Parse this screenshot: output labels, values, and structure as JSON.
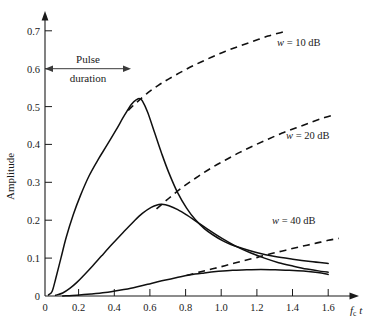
{
  "chart_data": {
    "type": "line",
    "title": "",
    "xlabel": "f_c t",
    "ylabel": "Amplitude",
    "xlim": [
      0,
      1.72
    ],
    "ylim": [
      0,
      0.74
    ],
    "grid": false,
    "legend_position": "inline-right",
    "xticks": [
      "0",
      "0.2",
      "0.4",
      "0.6",
      "0.8",
      "1.0",
      "1.2",
      "1.4",
      "1.6"
    ],
    "xtick_values": [
      0,
      0.2,
      0.4,
      0.6,
      0.8,
      1.0,
      1.2,
      1.4,
      1.6
    ],
    "yticks": [
      "0.1",
      "0.2",
      "0.3",
      "0.4",
      "0.5",
      "0.6",
      "0.7"
    ],
    "ytick_values": [
      0.1,
      0.2,
      0.3,
      0.4,
      0.5,
      0.6,
      0.7
    ],
    "yzero_label": "0",
    "annotations": [
      {
        "name": "pulse-duration",
        "line1": "Pulse",
        "line2": "duration",
        "arrow": "double-headed",
        "x_start": 0.0,
        "x_end": 0.47,
        "y": 0.6
      }
    ],
    "series": [
      {
        "name": "w = 10 dB (solid)",
        "label": "",
        "style": "solid",
        "x": [
          0.02,
          0.04,
          0.06,
          0.09,
          0.12,
          0.16,
          0.2,
          0.25,
          0.3,
          0.35,
          0.4,
          0.45,
          0.49,
          0.52,
          0.535,
          0.55,
          0.58,
          0.62,
          0.66,
          0.7,
          0.75,
          0.8,
          0.85,
          0.9,
          0.95,
          1.0,
          1.05,
          1.1,
          1.2,
          1.3,
          1.4,
          1.5,
          1.6
        ],
        "y": [
          0.003,
          0.012,
          0.045,
          0.1,
          0.155,
          0.215,
          0.265,
          0.318,
          0.36,
          0.398,
          0.437,
          0.478,
          0.507,
          0.519,
          0.521,
          0.515,
          0.485,
          0.43,
          0.375,
          0.325,
          0.272,
          0.232,
          0.201,
          0.178,
          0.161,
          0.147,
          0.136,
          0.128,
          0.114,
          0.104,
          0.097,
          0.091,
          0.086
        ]
      },
      {
        "name": "w = 20 dB (solid)",
        "label": "",
        "style": "solid",
        "x": [
          0.06,
          0.1,
          0.14,
          0.18,
          0.22,
          0.27,
          0.32,
          0.38,
          0.44,
          0.5,
          0.55,
          0.6,
          0.64,
          0.66,
          0.7,
          0.75,
          0.8,
          0.86,
          0.92,
          1.0,
          1.08,
          1.16,
          1.24,
          1.32,
          1.4,
          1.48,
          1.56,
          1.6
        ],
        "y": [
          0.002,
          0.008,
          0.02,
          0.036,
          0.055,
          0.08,
          0.106,
          0.137,
          0.167,
          0.196,
          0.218,
          0.234,
          0.241,
          0.242,
          0.238,
          0.228,
          0.214,
          0.195,
          0.176,
          0.152,
          0.131,
          0.114,
          0.1,
          0.088,
          0.079,
          0.071,
          0.065,
          0.063
        ]
      },
      {
        "name": "w = 40 dB (solid)",
        "label": "",
        "style": "solid",
        "x": [
          0.1,
          0.18,
          0.26,
          0.34,
          0.42,
          0.5,
          0.58,
          0.66,
          0.74,
          0.82,
          0.9,
          0.98,
          1.06,
          1.14,
          1.22,
          1.3,
          1.38,
          1.46,
          1.54,
          1.6
        ],
        "y": [
          0.0,
          0.002,
          0.005,
          0.009,
          0.015,
          0.022,
          0.031,
          0.04,
          0.048,
          0.056,
          0.061,
          0.065,
          0.068,
          0.069,
          0.07,
          0.069,
          0.068,
          0.066,
          0.062,
          0.057
        ]
      },
      {
        "name": "w = 10 dB (dashed envelope)",
        "label": "w = 10 dB",
        "style": "dashed",
        "x": [
          0.47,
          0.52,
          0.58,
          0.64,
          0.7,
          0.78,
          0.86,
          0.94,
          1.02,
          1.1,
          1.18,
          1.26,
          1.33,
          1.37
        ],
        "y": [
          0.49,
          0.512,
          0.536,
          0.556,
          0.573,
          0.594,
          0.613,
          0.63,
          0.646,
          0.66,
          0.673,
          0.686,
          0.695,
          0.7
        ]
      },
      {
        "name": "w = 20 dB (dashed envelope)",
        "label": "w = 20 dB",
        "style": "dashed",
        "x": [
          0.63,
          0.7,
          0.78,
          0.86,
          0.94,
          1.02,
          1.1,
          1.18,
          1.26,
          1.34,
          1.42,
          1.5,
          1.58,
          1.63
        ],
        "y": [
          0.23,
          0.258,
          0.288,
          0.314,
          0.338,
          0.359,
          0.379,
          0.397,
          0.414,
          0.43,
          0.444,
          0.458,
          0.471,
          0.478
        ]
      },
      {
        "name": "w = 40 dB (dashed envelope)",
        "label": "w = 40 dB",
        "style": "dashed",
        "x": [
          0.8,
          0.88,
          0.96,
          1.04,
          1.12,
          1.2,
          1.28,
          1.36,
          1.44,
          1.52,
          1.6,
          1.66
        ],
        "y": [
          0.054,
          0.064,
          0.073,
          0.083,
          0.093,
          0.102,
          0.112,
          0.121,
          0.13,
          0.138,
          0.147,
          0.152
        ]
      }
    ],
    "series_labels": [
      {
        "name": "label-10db",
        "text": "w = 10 dB",
        "w": "w",
        "rest": " =  10 dB",
        "px": 277,
        "py": 46
      },
      {
        "name": "label-20db",
        "text": "w = 20 dB",
        "w": "w",
        "rest": " =  20 dB",
        "px": 286,
        "py": 139
      },
      {
        "name": "label-40db",
        "text": "w = 40 dB",
        "w": "w",
        "rest": " =  40 dB",
        "px": 272,
        "py": 224
      }
    ]
  }
}
